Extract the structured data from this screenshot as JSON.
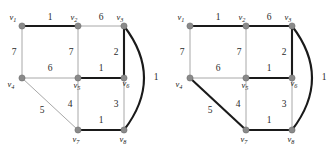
{
  "figure": {
    "panels": [
      {
        "id": "left",
        "name": "graph-panel-left",
        "vertices": [
          {
            "id": "v1",
            "label": "v",
            "sub": "1",
            "x": 22,
            "y": 26,
            "label_dx": -9,
            "label_dy": -6
          },
          {
            "id": "v2",
            "label": "v",
            "sub": "2",
            "x": 78,
            "y": 26,
            "label_dx": -4,
            "label_dy": -6
          },
          {
            "id": "v3",
            "label": "v",
            "sub": "3",
            "x": 124,
            "y": 26,
            "label_dx": -4,
            "label_dy": -6
          },
          {
            "id": "v4",
            "label": "v",
            "sub": "4",
            "x": 22,
            "y": 78,
            "label_dx": -11,
            "label_dy": 9
          },
          {
            "id": "v5",
            "label": "v",
            "sub": "5",
            "x": 78,
            "y": 78,
            "label_dx": -1,
            "label_dy": 10
          },
          {
            "id": "v6",
            "label": "v",
            "sub": "6",
            "x": 124,
            "y": 78,
            "label_dx": 2,
            "label_dy": 8
          },
          {
            "id": "v7",
            "label": "v",
            "sub": "7",
            "x": 78,
            "y": 130,
            "label_dx": -2,
            "label_dy": 12
          },
          {
            "id": "v8",
            "label": "v",
            "sub": "8",
            "x": 124,
            "y": 130,
            "label_dx": -1,
            "label_dy": 12
          }
        ],
        "edges": [
          {
            "from": "v1",
            "to": "v2",
            "weight": "1",
            "bold": true,
            "wx": 50,
            "wy": 20,
            "curved": false
          },
          {
            "from": "v2",
            "to": "v3",
            "weight": "6",
            "bold": false,
            "wx": 101,
            "wy": 20,
            "curved": false
          },
          {
            "from": "v1",
            "to": "v4",
            "weight": "7",
            "bold": false,
            "wx": 14,
            "wy": 55,
            "curved": false
          },
          {
            "from": "v2",
            "to": "v5",
            "weight": "7",
            "bold": false,
            "wx": 71,
            "wy": 55,
            "curved": false
          },
          {
            "from": "v3",
            "to": "v6",
            "weight": "2",
            "bold": true,
            "wx": 116,
            "wy": 55,
            "curved": false
          },
          {
            "from": "v4",
            "to": "v5",
            "weight": "6",
            "bold": false,
            "wx": 50,
            "wy": 71,
            "curved": false
          },
          {
            "from": "v5",
            "to": "v6",
            "weight": "1",
            "bold": true,
            "wx": 101,
            "wy": 71,
            "curved": false
          },
          {
            "from": "v4",
            "to": "v7",
            "weight": "5",
            "bold": false,
            "wx": 42,
            "wy": 113,
            "curved": false
          },
          {
            "from": "v5",
            "to": "v7",
            "weight": "4",
            "bold": false,
            "wx": 70,
            "wy": 107,
            "curved": false
          },
          {
            "from": "v6",
            "to": "v8",
            "weight": "3",
            "bold": false,
            "wx": 116,
            "wy": 107,
            "curved": false
          },
          {
            "from": "v7",
            "to": "v8",
            "weight": "1",
            "bold": true,
            "wx": 101,
            "wy": 123,
            "curved": false
          },
          {
            "from": "v3",
            "to": "v8",
            "weight": "1",
            "bold": true,
            "wx": 156,
            "wy": 80,
            "curved": true,
            "cx": 164,
            "cy": 78
          }
        ]
      },
      {
        "id": "right",
        "name": "graph-panel-right",
        "vertices": [
          {
            "id": "v1",
            "label": "v",
            "sub": "1",
            "x": 22,
            "y": 26,
            "label_dx": -9,
            "label_dy": -6
          },
          {
            "id": "v2",
            "label": "v",
            "sub": "2",
            "x": 78,
            "y": 26,
            "label_dx": -4,
            "label_dy": -6
          },
          {
            "id": "v3",
            "label": "v",
            "sub": "3",
            "x": 124,
            "y": 26,
            "label_dx": -4,
            "label_dy": -6
          },
          {
            "id": "v4",
            "label": "v",
            "sub": "4",
            "x": 22,
            "y": 78,
            "label_dx": -11,
            "label_dy": 9
          },
          {
            "id": "v5",
            "label": "v",
            "sub": "5",
            "x": 78,
            "y": 78,
            "label_dx": -1,
            "label_dy": 10
          },
          {
            "id": "v6",
            "label": "v",
            "sub": "6",
            "x": 124,
            "y": 78,
            "label_dx": 2,
            "label_dy": 8
          },
          {
            "id": "v7",
            "label": "v",
            "sub": "7",
            "x": 78,
            "y": 130,
            "label_dx": -2,
            "label_dy": 12
          },
          {
            "id": "v8",
            "label": "v",
            "sub": "8",
            "x": 124,
            "y": 130,
            "label_dx": -1,
            "label_dy": 12
          }
        ],
        "edges": [
          {
            "from": "v1",
            "to": "v2",
            "weight": "1",
            "bold": true,
            "wx": 50,
            "wy": 20,
            "curved": false
          },
          {
            "from": "v2",
            "to": "v3",
            "weight": "6",
            "bold": true,
            "wx": 101,
            "wy": 20,
            "curved": false
          },
          {
            "from": "v1",
            "to": "v4",
            "weight": "7",
            "bold": false,
            "wx": 14,
            "wy": 55,
            "curved": false
          },
          {
            "from": "v2",
            "to": "v5",
            "weight": "7",
            "bold": false,
            "wx": 71,
            "wy": 55,
            "curved": false
          },
          {
            "from": "v3",
            "to": "v6",
            "weight": "2",
            "bold": true,
            "wx": 116,
            "wy": 55,
            "curved": false
          },
          {
            "from": "v4",
            "to": "v5",
            "weight": "6",
            "bold": false,
            "wx": 50,
            "wy": 71,
            "curved": false
          },
          {
            "from": "v5",
            "to": "v6",
            "weight": "1",
            "bold": true,
            "wx": 101,
            "wy": 71,
            "curved": false
          },
          {
            "from": "v4",
            "to": "v7",
            "weight": "5",
            "bold": true,
            "wx": 42,
            "wy": 113,
            "curved": false
          },
          {
            "from": "v5",
            "to": "v7",
            "weight": "4",
            "bold": false,
            "wx": 70,
            "wy": 107,
            "curved": false
          },
          {
            "from": "v6",
            "to": "v8",
            "weight": "3",
            "bold": false,
            "wx": 116,
            "wy": 107,
            "curved": false
          },
          {
            "from": "v7",
            "to": "v8",
            "weight": "1",
            "bold": true,
            "wx": 101,
            "wy": 123,
            "curved": false
          },
          {
            "from": "v3",
            "to": "v8",
            "weight": "1",
            "bold": true,
            "wx": 156,
            "wy": 80,
            "curved": true,
            "cx": 164,
            "cy": 78
          }
        ]
      }
    ],
    "style": {
      "edge_thin_color": "#a8a8a8",
      "edge_bold_color": "#1a1a1a",
      "edge_thin_width": 1.0,
      "edge_bold_width": 2.1,
      "vertex_fill": "#8a8a8a",
      "vertex_stroke": "#6e6e6e",
      "vertex_radius": 3.1,
      "label_color": "#1a1a1a",
      "weight_color": "#2a2a2a",
      "background": "#ffffff"
    }
  }
}
